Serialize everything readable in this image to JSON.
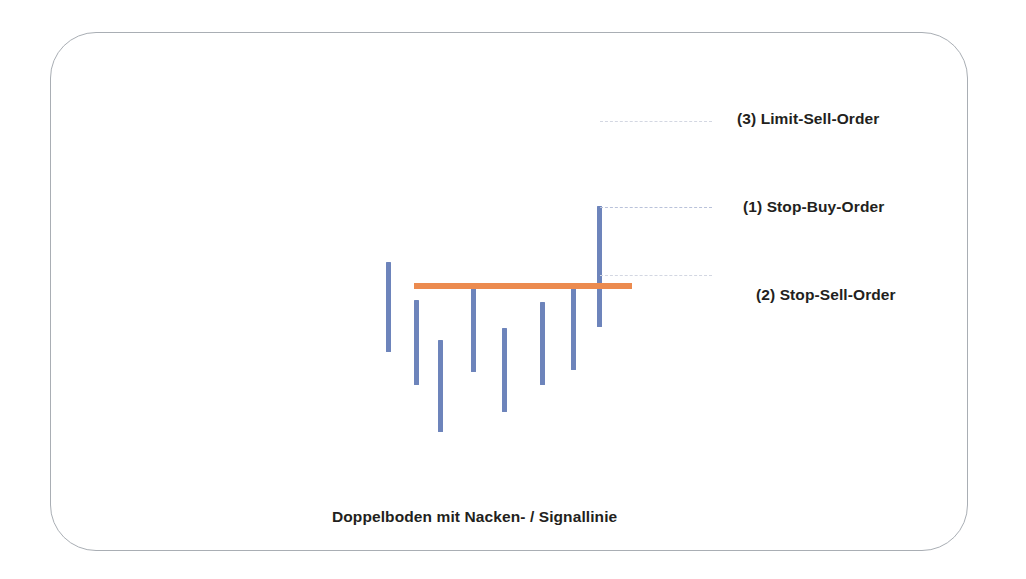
{
  "figure": {
    "caption": "Doppelboden mit Nacken- / Signallinie",
    "caption_x": 332,
    "caption_y": 508,
    "frame": {
      "x": 50,
      "y": 32,
      "width": 918,
      "height": 519,
      "corner_radius": 46,
      "border_color": "#a9aeb4"
    }
  },
  "colors": {
    "bar": "#6d84bb",
    "neckline": "#ec8b4f",
    "leader": "#b9c2da",
    "leader_faint": "#d3d7e2",
    "text": "#231f20",
    "background": "#ffffff"
  },
  "annotations": [
    {
      "id": "limit-sell-order",
      "label": "(3) Limit-Sell-Order",
      "text_x": 737,
      "text_y": 110,
      "leader": {
        "x": 600,
        "y": 121,
        "width": 112,
        "faint": true
      }
    },
    {
      "id": "stop-buy-order",
      "label": "(1) Stop-Buy-Order",
      "text_x": 743,
      "text_y": 198,
      "leader": {
        "x": 600,
        "y": 207,
        "width": 112,
        "faint": false
      }
    },
    {
      "id": "stop-sell-order",
      "label": "(2) Stop-Sell-Order",
      "text_x": 756,
      "text_y": 286,
      "leader": {
        "x": 600,
        "y": 275,
        "width": 112,
        "faint": true
      }
    }
  ],
  "chart_data": {
    "type": "bar",
    "subtype": "ohlc-price-bars",
    "title": "Doppelboden mit Nacken- / Signallinie",
    "xlabel": "",
    "ylabel": "",
    "grid": false,
    "legend_position": "right",
    "axis_note": "No numeric axes drawn; values given as pixel top/bottom of each vertical price bar.",
    "categories": [
      "1",
      "2",
      "3",
      "4",
      "5",
      "6",
      "7",
      "8"
    ],
    "bars": [
      {
        "index": 1,
        "x": 386,
        "top": 262,
        "bottom": 352,
        "height": 90
      },
      {
        "index": 2,
        "x": 414,
        "top": 300,
        "bottom": 385,
        "height": 85
      },
      {
        "index": 3,
        "x": 438,
        "top": 340,
        "bottom": 432,
        "height": 92
      },
      {
        "index": 4,
        "x": 471,
        "top": 285,
        "bottom": 372,
        "height": 87
      },
      {
        "index": 5,
        "x": 502,
        "top": 328,
        "bottom": 412,
        "height": 84
      },
      {
        "index": 6,
        "x": 540,
        "top": 302,
        "bottom": 385,
        "height": 83
      },
      {
        "index": 7,
        "x": 571,
        "top": 288,
        "bottom": 370,
        "height": 82
      },
      {
        "index": 8,
        "x": 597,
        "top": 206,
        "bottom": 327,
        "height": 121
      }
    ],
    "bar_width": 5,
    "neckline": {
      "label": "Nacken- / Signallinie",
      "x_start": 414,
      "x_end": 632,
      "y": 283,
      "thickness": 6,
      "color": "#ec8b4f"
    },
    "order_levels": [
      {
        "name": "(3) Limit-Sell-Order",
        "y": 121
      },
      {
        "name": "(1) Stop-Buy-Order",
        "y": 207
      },
      {
        "name": "(2) Stop-Sell-Order",
        "y": 275
      }
    ]
  }
}
